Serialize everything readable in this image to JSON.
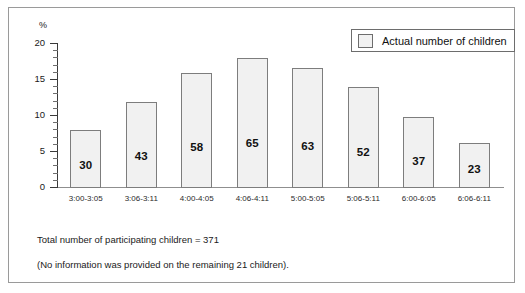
{
  "chart_data": {
    "type": "bar",
    "title": "",
    "xlabel": "",
    "ylabel": "%",
    "ylim": [
      0,
      20
    ],
    "ytick_labels": [
      "0",
      "5",
      "10",
      "15",
      "20"
    ],
    "ytick_values": [
      0,
      5,
      10,
      15,
      20
    ],
    "minor_tick_step": 1,
    "grid": false,
    "legend_position": "top-right",
    "legend_entries": [
      "Actual number of children"
    ],
    "categories": [
      "3:00-3:05",
      "3:06-3:11",
      "4:00-4:05",
      "4:06-4:11",
      "5:00-5:05",
      "5:06-5:11",
      "6:00-6:05",
      "6:06-6:11"
    ],
    "values": [
      8.1,
      11.9,
      16.0,
      18.1,
      16.7,
      14.0,
      9.9,
      6.2
    ],
    "bar_labels": [
      "30",
      "43",
      "58",
      "65",
      "63",
      "52",
      "37",
      "23"
    ],
    "counts": [
      30,
      43,
      58,
      65,
      63,
      52,
      37,
      23
    ],
    "series": [
      {
        "name": "Actual number of children",
        "values": [
          8.1,
          11.9,
          16.0,
          18.1,
          16.7,
          14.0,
          9.9,
          6.2
        ],
        "counts": [
          30,
          43,
          58,
          65,
          63,
          52,
          37,
          23
        ]
      }
    ],
    "annotations": [
      "Total number of participating children = 371",
      "(No information was provided on the remaining 21 children)."
    ],
    "colors": {
      "bar_fill": "#f1f1f1",
      "bar_border": "#7d7d7d",
      "axis": "#3a3a3a",
      "frame": "#9a9a9a",
      "text": "#1a1a1a"
    }
  },
  "axis": {
    "unit_label": "%",
    "y_labels": [
      "20",
      "15",
      "10",
      "5",
      "0"
    ]
  },
  "legend": {
    "label": "Actual number of children"
  },
  "footnotes": {
    "total": "Total number of participating children = 371",
    "note": "(No information was provided on the remaining 21 children)."
  }
}
